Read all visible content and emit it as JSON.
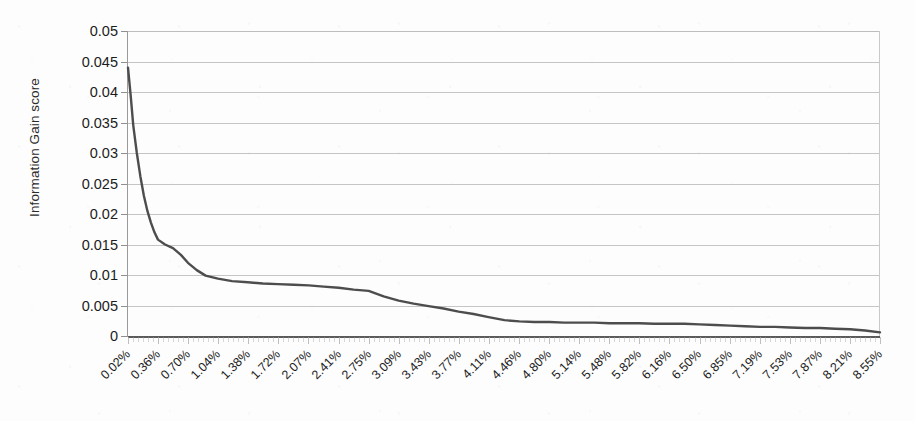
{
  "chart_data": {
    "type": "line",
    "title": "",
    "xlabel": "",
    "ylabel": "Information Gain score",
    "ylim": [
      0,
      0.05
    ],
    "grid": true,
    "legend": "none",
    "y_ticks": [
      "0",
      "0.005",
      "0.01",
      "0.015",
      "0.02",
      "0.025",
      "0.03",
      "0.035",
      "0.04",
      "0.045",
      "0.05"
    ],
    "y_tick_values": [
      0,
      0.005,
      0.01,
      0.015,
      0.02,
      0.025,
      0.03,
      0.035,
      0.04,
      0.045,
      0.05
    ],
    "categories": [
      "0.02%",
      "0.36%",
      "0.70%",
      "1.04%",
      "1.38%",
      "1.72%",
      "2.07%",
      "2.41%",
      "2.75%",
      "3.09%",
      "3.43%",
      "3.77%",
      "4.11%",
      "4.46%",
      "4.80%",
      "5.14%",
      "5.48%",
      "5.82%",
      "6.16%",
      "6.50%",
      "6.85%",
      "7.19%",
      "7.53%",
      "7.87%",
      "8.21%",
      "8.55%"
    ],
    "series": [
      {
        "name": "Information Gain score",
        "color": "#4d4d4d",
        "x": [
          0.02,
          0.05,
          0.08,
          0.12,
          0.16,
          0.2,
          0.24,
          0.28,
          0.32,
          0.36,
          0.44,
          0.53,
          0.62,
          0.7,
          0.8,
          0.9,
          1.04,
          1.2,
          1.38,
          1.55,
          1.72,
          1.9,
          2.07,
          2.24,
          2.41,
          2.58,
          2.75,
          2.92,
          3.09,
          3.26,
          3.43,
          3.6,
          3.77,
          3.94,
          4.11,
          4.29,
          4.46,
          4.63,
          4.8,
          4.97,
          5.14,
          5.31,
          5.48,
          5.65,
          5.82,
          5.99,
          6.16,
          6.33,
          6.5,
          6.68,
          6.85,
          7.02,
          7.19,
          7.36,
          7.53,
          7.7,
          7.87,
          8.04,
          8.21,
          8.38,
          8.55
        ],
        "values": [
          0.044,
          0.0395,
          0.0345,
          0.03,
          0.0262,
          0.023,
          0.0205,
          0.0186,
          0.017,
          0.0158,
          0.015,
          0.0144,
          0.0133,
          0.012,
          0.0108,
          0.0099,
          0.0094,
          0.009,
          0.0088,
          0.0086,
          0.0085,
          0.0084,
          0.0083,
          0.0081,
          0.0079,
          0.0076,
          0.0074,
          0.0065,
          0.0058,
          0.0053,
          0.0049,
          0.0045,
          0.004,
          0.0036,
          0.0031,
          0.0026,
          0.0024,
          0.0023,
          0.0023,
          0.0022,
          0.0022,
          0.0022,
          0.0021,
          0.0021,
          0.0021,
          0.002,
          0.002,
          0.002,
          0.0019,
          0.0018,
          0.0017,
          0.0016,
          0.0015,
          0.0015,
          0.0014,
          0.0013,
          0.0013,
          0.0012,
          0.0011,
          0.0009,
          0.0006
        ]
      }
    ]
  }
}
